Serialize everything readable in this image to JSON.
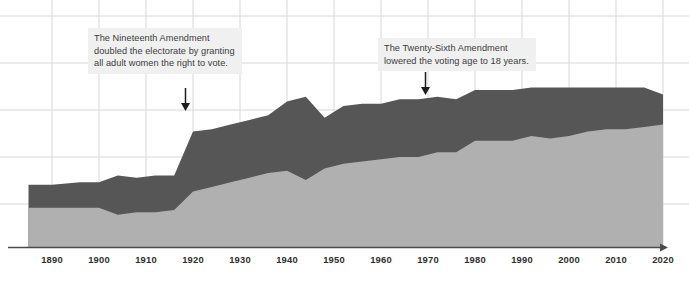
{
  "chart_data": {
    "type": "area",
    "title": "",
    "subtitle": "",
    "xlabel": "",
    "ylabel": "",
    "stacked": true,
    "grid": true,
    "legend_position": "none",
    "xlim": [
      1885,
      2020
    ],
    "ylim": [
      0,
      100
    ],
    "categories": [
      1890,
      1900,
      1910,
      1920,
      1930,
      1940,
      1950,
      1960,
      1970,
      1980,
      1990,
      2000,
      2010,
      2020
    ],
    "tick_labels": [
      "1890",
      "1900",
      "1910",
      "1920",
      "1930",
      "1940",
      "1950",
      "1960",
      "1970",
      "1980",
      "1990",
      "2000",
      "2010",
      "2020"
    ],
    "series": [
      {
        "name": "lower-band",
        "color": "#b0b0b0",
        "x": [
          1885,
          1890,
          1896,
          1900,
          1904,
          1908,
          1912,
          1916,
          1920,
          1924,
          1928,
          1932,
          1936,
          1940,
          1944,
          1948,
          1952,
          1956,
          1960,
          1964,
          1968,
          1972,
          1976,
          1980,
          1984,
          1988,
          1992,
          1996,
          2000,
          2004,
          2008,
          2012,
          2016,
          2020
        ],
        "values": [
          17,
          17,
          17,
          17,
          14,
          15,
          15,
          16,
          24,
          26,
          28,
          30,
          32,
          33,
          29,
          34,
          36,
          37,
          38,
          39,
          39,
          41,
          41,
          46,
          46,
          46,
          48,
          47,
          48,
          50,
          51,
          51,
          52,
          53
        ]
      },
      {
        "name": "upper-band",
        "color": "#565656",
        "x": [
          1885,
          1890,
          1896,
          1900,
          1904,
          1908,
          1912,
          1916,
          1920,
          1924,
          1928,
          1932,
          1936,
          1940,
          1944,
          1948,
          1952,
          1956,
          1960,
          1964,
          1968,
          1972,
          1976,
          1980,
          1984,
          1988,
          1992,
          1996,
          2000,
          2004,
          2008,
          2012,
          2016,
          2020
        ],
        "values": [
          27,
          27,
          28,
          28,
          31,
          30,
          31,
          31,
          50,
          51,
          53,
          55,
          57,
          63,
          65,
          56,
          61,
          62,
          62,
          64,
          64,
          65,
          64,
          68,
          68,
          68,
          69,
          69,
          69,
          69,
          69,
          69,
          69,
          66
        ]
      }
    ],
    "annotations": [
      {
        "id": "nineteenth-amendment",
        "text": "The Nineteenth Amendment\ndoubled the electorate by granting\nall adult women the right to vote.",
        "points_to_year": 1920,
        "arrow": "down"
      },
      {
        "id": "twenty-sixth-amendment",
        "text": "The Twenty-Sixth Amendment\nlowered the voting age to 18 years.",
        "points_to_year": 1971,
        "arrow": "down"
      }
    ],
    "colors": {
      "upper_band": "#565656",
      "lower_band": "#b0b0b0",
      "grid": "#d8d8d8",
      "axis": "#4a4a4a",
      "annotation_background": "#f0f0f0",
      "annotation_text": "#3b3b3b",
      "tick_text": "#2f2f2f"
    }
  }
}
